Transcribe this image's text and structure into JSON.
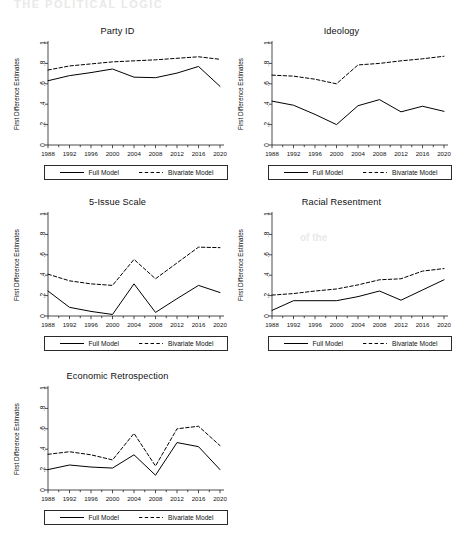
{
  "page": {
    "background": "#ffffff",
    "series_colors": {
      "full_model": "#000000",
      "bivariate_model": "#000000"
    }
  },
  "legend": {
    "full_model_label": "Full Model",
    "bivariate_model_label": "Bivariate Model"
  },
  "axis": {
    "ylabel": "First Difference Estimates",
    "yticks": [
      "0",
      ".2",
      ".4",
      ".6",
      ".8",
      "1"
    ],
    "xticks": [
      "1988",
      "1992",
      "1996",
      "2000",
      "2004",
      "2008",
      "2012",
      "2016",
      "2020"
    ]
  },
  "bleed_text": {
    "top": "THE POLITICAL LOGIC",
    "mid": "of the"
  },
  "chart_data": [
    {
      "type": "line",
      "title": "Party ID",
      "xlabel": "",
      "ylabel": "First Difference Estimates",
      "x": [
        1988,
        1992,
        1996,
        2000,
        2004,
        2008,
        2012,
        2016,
        2020
      ],
      "xlim": [
        1988,
        2020
      ],
      "ylim": [
        0,
        1
      ],
      "grid": false,
      "legend_position": "below",
      "series": [
        {
          "name": "Full Model",
          "style": "solid",
          "values": [
            0.63,
            0.68,
            0.71,
            0.745,
            0.665,
            0.66,
            0.705,
            0.77,
            0.575
          ]
        },
        {
          "name": "Bivariate Model",
          "style": "dashed",
          "values": [
            0.735,
            0.775,
            0.795,
            0.815,
            0.825,
            0.835,
            0.85,
            0.865,
            0.84
          ]
        }
      ]
    },
    {
      "type": "line",
      "title": "Ideology",
      "xlabel": "",
      "ylabel": "First Difference Estimates",
      "x": [
        1988,
        1992,
        1996,
        2000,
        2004,
        2008,
        2012,
        2016,
        2020
      ],
      "xlim": [
        1988,
        2020
      ],
      "ylim": [
        0,
        1
      ],
      "grid": false,
      "legend_position": "below",
      "series": [
        {
          "name": "Full Model",
          "style": "solid",
          "values": [
            0.43,
            0.39,
            0.3,
            0.2,
            0.385,
            0.445,
            0.325,
            0.38,
            0.33
          ]
        },
        {
          "name": "Bivariate Model",
          "style": "dashed",
          "values": [
            0.685,
            0.675,
            0.645,
            0.6,
            0.785,
            0.8,
            0.825,
            0.845,
            0.87
          ]
        }
      ]
    },
    {
      "type": "line",
      "title": "5-Issue Scale",
      "xlabel": "",
      "ylabel": "First Difference Estimates",
      "x": [
        1988,
        1992,
        1996,
        2000,
        2004,
        2008,
        2012,
        2016,
        2020
      ],
      "xlim": [
        1988,
        2020
      ],
      "ylim": [
        0,
        1
      ],
      "grid": false,
      "legend_position": "below",
      "series": [
        {
          "name": "Full Model",
          "style": "solid",
          "values": [
            0.245,
            0.085,
            0.045,
            0.015,
            0.315,
            0.035,
            0.17,
            0.3,
            0.23
          ]
        },
        {
          "name": "Bivariate Model",
          "style": "dashed",
          "values": [
            0.41,
            0.345,
            0.315,
            0.3,
            0.555,
            0.365,
            0.52,
            0.675,
            0.67
          ]
        }
      ]
    },
    {
      "type": "line",
      "title": "Racial Resentment",
      "xlabel": "",
      "ylabel": "First Difference Estimates",
      "x": [
        1988,
        1992,
        1996,
        2000,
        2004,
        2008,
        2012,
        2016,
        2020
      ],
      "xlim": [
        1988,
        2020
      ],
      "ylim": [
        0,
        1
      ],
      "grid": false,
      "legend_position": "below",
      "series": [
        {
          "name": "Full Model",
          "style": "solid",
          "values": [
            0.055,
            0.15,
            0.15,
            0.15,
            0.19,
            0.245,
            0.155,
            0.255,
            0.355
          ]
        },
        {
          "name": "Bivariate Model",
          "style": "dashed",
          "values": [
            0.205,
            0.22,
            0.245,
            0.265,
            0.305,
            0.355,
            0.365,
            0.44,
            0.465
          ]
        }
      ]
    },
    {
      "type": "line",
      "title": "Economic Retrospection",
      "xlabel": "",
      "ylabel": "First Difference Estimates",
      "x": [
        1988,
        1992,
        1996,
        2000,
        2004,
        2008,
        2012,
        2016,
        2020
      ],
      "xlim": [
        1988,
        2020
      ],
      "ylim": [
        0,
        1
      ],
      "grid": false,
      "legend_position": "below",
      "series": [
        {
          "name": "Full Model",
          "style": "solid",
          "values": [
            0.2,
            0.245,
            0.225,
            0.215,
            0.345,
            0.145,
            0.465,
            0.425,
            0.2
          ]
        },
        {
          "name": "Bivariate Model",
          "style": "dashed",
          "values": [
            0.35,
            0.375,
            0.345,
            0.295,
            0.555,
            0.235,
            0.6,
            0.625,
            0.435
          ]
        }
      ]
    }
  ]
}
